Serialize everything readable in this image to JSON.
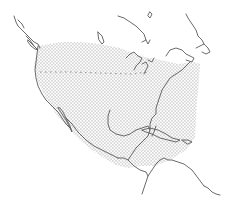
{
  "map": {
    "type": "species-range-map",
    "region": "North America",
    "legend": [],
    "labels": [],
    "colors": {
      "background": "#ffffff",
      "coastline": "#5a5a5a",
      "range_stipple": "#8c8c8c",
      "border_dashes": "#777777"
    },
    "layers": [
      {
        "name": "coastline",
        "style": "thin gray line"
      },
      {
        "name": "range",
        "style": "stippled dot pattern",
        "extent": "southern Canada through USA, Mexico, Central America and Caribbean"
      },
      {
        "name": "us-canada-border",
        "style": "dashed line"
      }
    ]
  }
}
